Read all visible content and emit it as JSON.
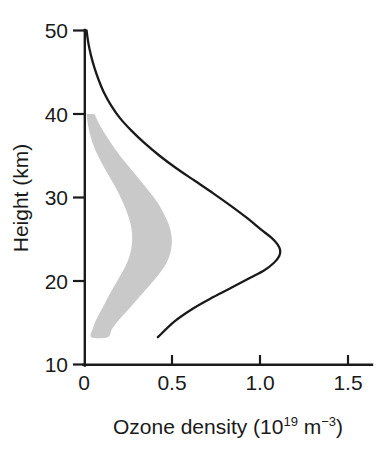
{
  "chart_data": {
    "type": "line",
    "title": "",
    "xlabel": "Ozone density (10¹⁹ m⁻³)",
    "xlabel_parts": {
      "base": "Ozone density (10",
      "exponent": "19",
      "mid": " m",
      "exponent2": "−3",
      "close": ")"
    },
    "ylabel": "Height (km)",
    "xlim": [
      0,
      1.65
    ],
    "ylim": [
      10,
      50
    ],
    "xticks": [
      0,
      0.5,
      1.0,
      1.5
    ],
    "xtick_labels": [
      "0",
      "0.5",
      "1.0",
      "1.5"
    ],
    "yticks": [
      10,
      20,
      30,
      40,
      50
    ],
    "ytick_labels": [
      "10",
      "20",
      "30",
      "40",
      "50"
    ],
    "grid": false,
    "legend": "none",
    "series": [
      {
        "name": "ozone-density-profile",
        "description": "Mid-latitude ozone number density profile, peaking near 24 km",
        "color": "#1a1a1a",
        "style": "solid-line",
        "x": [
          0.01,
          0.02,
          0.035,
          0.055,
          0.08,
          0.11,
          0.15,
          0.2,
          0.265,
          0.34,
          0.425,
          0.52,
          0.625,
          0.73,
          0.83,
          0.925,
          1.0,
          1.06,
          1.095,
          1.11,
          1.105,
          1.075,
          1.02,
          0.94,
          0.84,
          0.73,
          0.62,
          0.51,
          0.415
        ],
        "y": [
          50.0,
          48.5,
          47.0,
          45.5,
          44.0,
          42.5,
          41.0,
          39.5,
          38.0,
          36.5,
          35.0,
          33.5,
          32.0,
          30.5,
          29.0,
          27.5,
          26.2,
          25.2,
          24.4,
          23.7,
          23.0,
          22.2,
          21.3,
          20.4,
          19.3,
          18.1,
          16.8,
          15.2,
          13.3
        ]
      }
    ],
    "shaded_band": {
      "name": "uncertainty-band",
      "description": "Grey shaded band indicating range of observed ozone densities",
      "color": "#c9c9c9",
      "top_height": 40.0,
      "bottom_height": 13.3,
      "left_edge_x": [
        0.01,
        0.02,
        0.04,
        0.075,
        0.12,
        0.17,
        0.215,
        0.25,
        0.268,
        0.265,
        0.24,
        0.195,
        0.145,
        0.1,
        0.065,
        0.045,
        0.038
      ],
      "left_edge_y": [
        40.0,
        38.5,
        36.8,
        35.0,
        33.2,
        31.4,
        29.5,
        27.6,
        25.8,
        24.0,
        22.2,
        20.4,
        18.6,
        16.8,
        15.4,
        14.3,
        13.3
      ],
      "right_edge_x": [
        0.055,
        0.09,
        0.14,
        0.2,
        0.27,
        0.34,
        0.41,
        0.46,
        0.49,
        0.492,
        0.465,
        0.405,
        0.33,
        0.255,
        0.195,
        0.155,
        0.13
      ],
      "right_edge_y": [
        40.0,
        38.5,
        36.8,
        35.0,
        33.2,
        31.4,
        29.5,
        27.6,
        25.8,
        24.0,
        22.2,
        20.4,
        18.6,
        16.8,
        15.4,
        14.3,
        13.3
      ]
    },
    "annotations": [],
    "peak": {
      "x": 1.11,
      "y": 23.7
    },
    "colors": {
      "axis": "#1a1a1a",
      "curve": "#1a1a1a",
      "band": "#c9c9c9",
      "background": "#ffffff"
    }
  }
}
